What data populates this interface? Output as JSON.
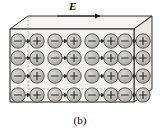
{
  "figure": {
    "caption": "(b)",
    "field_label": "E",
    "field_arrow_direction": "right",
    "colors": {
      "outline": "#1a1a1a",
      "slab_fill": "#f2f2f0",
      "slab_face_fill": "#eceae7",
      "molecule_fill": "#b5b3b1",
      "molecule_fill_light": "#c9c7c5",
      "molecule_outline": "#4d4b4a",
      "charge_sign": "#2b2b2b",
      "dashed_edge": "#8c8a88",
      "arrow": "#2b2b2b",
      "background": "#ffffff"
    },
    "slab": {
      "description": "3d-rectangular-slab",
      "front_face": {
        "x": 10,
        "y": 29,
        "width": 124,
        "height": 73
      },
      "depth_offset": {
        "dx": 18,
        "dy": -13
      }
    },
    "lattice": {
      "rows": 4,
      "molecules_per_row": 8,
      "pairs_per_row": 4,
      "row_y": [
        41,
        58,
        76,
        95
      ],
      "column_x": [
        18,
        34,
        53,
        69,
        88,
        104,
        123,
        139
      ],
      "molecule_radius": 7.2,
      "pair_sign_order": [
        "-",
        "+"
      ]
    },
    "molecule_rows": [
      {
        "row_index": 0,
        "molecules": [
          {
            "sign": "-",
            "cx": 18
          },
          {
            "sign": "+",
            "cx": 37
          },
          {
            "sign": "-",
            "cx": 55
          },
          {
            "sign": "+",
            "cx": 74
          },
          {
            "sign": "-",
            "cx": 92
          },
          {
            "sign": "+",
            "cx": 111
          },
          {
            "sign": "-",
            "cx": 125
          },
          {
            "sign": "+",
            "cx": 143
          }
        ]
      },
      {
        "row_index": 1,
        "molecules": [
          {
            "sign": "-",
            "cx": 18
          },
          {
            "sign": "+",
            "cx": 37
          },
          {
            "sign": "-",
            "cx": 55
          },
          {
            "sign": "+",
            "cx": 74
          },
          {
            "sign": "-",
            "cx": 92
          },
          {
            "sign": "+",
            "cx": 111
          },
          {
            "sign": "-",
            "cx": 125
          },
          {
            "sign": "+",
            "cx": 143
          }
        ]
      },
      {
        "row_index": 2,
        "molecules": [
          {
            "sign": "-",
            "cx": 18
          },
          {
            "sign": "+",
            "cx": 37
          },
          {
            "sign": "-",
            "cx": 55
          },
          {
            "sign": "+",
            "cx": 74
          },
          {
            "sign": "-",
            "cx": 92
          },
          {
            "sign": "+",
            "cx": 111
          },
          {
            "sign": "-",
            "cx": 125
          },
          {
            "sign": "+",
            "cx": 143
          }
        ]
      },
      {
        "row_index": 3,
        "molecules": [
          {
            "sign": "-",
            "cx": 18
          },
          {
            "sign": "+",
            "cx": 37
          },
          {
            "sign": "-",
            "cx": 55
          },
          {
            "sign": "+",
            "cx": 74
          },
          {
            "sign": "-",
            "cx": 92
          },
          {
            "sign": "+",
            "cx": 111
          },
          {
            "sign": "-",
            "cx": 125
          },
          {
            "sign": "+",
            "cx": 143
          }
        ]
      }
    ],
    "field_arrow": {
      "x1": 57,
      "x2": 103,
      "y": 16
    }
  }
}
